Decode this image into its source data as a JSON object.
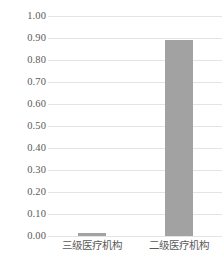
{
  "chart_data": {
    "type": "bar",
    "title": "",
    "subtitle": "",
    "xlabel": "",
    "ylabel": "",
    "categories": [
      "三级医疗机构",
      "二级医疗机构"
    ],
    "values": [
      0.01,
      0.89
    ],
    "series": [
      {
        "name": "",
        "values": [
          0.01,
          0.89
        ]
      }
    ],
    "ylim": [
      0.0,
      1.0
    ],
    "ytick_labels": [
      "1.00",
      "0.90",
      "0.80",
      "0.70",
      "0.60",
      "0.50",
      "0.40",
      "0.30",
      "0.20",
      "0.10",
      "0.00"
    ],
    "ytick_values": [
      1.0,
      0.9,
      0.8,
      0.7,
      0.6,
      0.5,
      0.4,
      0.3,
      0.2,
      0.1,
      0.0
    ],
    "ytick_interval": 0.1,
    "grid": true,
    "grid_axis": "y",
    "legend": false,
    "legend_position": "none",
    "bar_color": "#a2a2a2",
    "grid_color": "#e4e4e4",
    "text_color": "#5a5a5a",
    "background_color": "#ffffff",
    "annotations": []
  }
}
